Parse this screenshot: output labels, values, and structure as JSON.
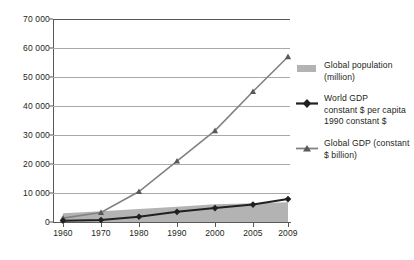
{
  "chart_data": {
    "type": "line",
    "title": "",
    "subtitle": "",
    "xlabel": "",
    "ylabel": "",
    "categories": [
      "1960",
      "1970",
      "1980",
      "1990",
      "2000",
      "2005",
      "2009"
    ],
    "x_positions": [
      0,
      1,
      2,
      3,
      4,
      4.5,
      4.9
    ],
    "ylim": [
      0,
      70000
    ],
    "yticks": [
      "0",
      "10 000",
      "20 000",
      "30 000",
      "40 000",
      "50 000",
      "60 000",
      "70 000"
    ],
    "ytick_values": [
      0,
      10000,
      20000,
      30000,
      40000,
      50000,
      60000,
      70000
    ],
    "grid": "horizontal",
    "legend_position": "right",
    "series": [
      {
        "name": "Global population (million)",
        "type": "area",
        "color": "#b3b3b3",
        "values": [
          3000,
          3700,
          4450,
          5300,
          6100,
          6500,
          6800
        ]
      },
      {
        "name": "World GDP constant $ per capita 1990 constant $",
        "type": "line",
        "color": "#231f20",
        "marker": "diamond",
        "values": [
          450,
          700,
          1800,
          3500,
          4800,
          6000,
          7900
        ]
      },
      {
        "name": "Global GDP (constant $ billion)",
        "type": "line",
        "color": "#808285",
        "marker": "triangle",
        "values": [
          1350,
          3300,
          10500,
          21000,
          31500,
          45000,
          57000
        ]
      }
    ]
  },
  "legend": {
    "items": [
      {
        "marker": "area-swatch",
        "lines": [
          "Global population",
          "(million)"
        ]
      },
      {
        "marker": "line-diamond",
        "lines": [
          "World GDP",
          "constant $ per capita",
          "1990 constant $"
        ]
      },
      {
        "marker": "line-triangle",
        "lines": [
          "Global GDP (constant",
          "$ billion)"
        ]
      }
    ]
  }
}
